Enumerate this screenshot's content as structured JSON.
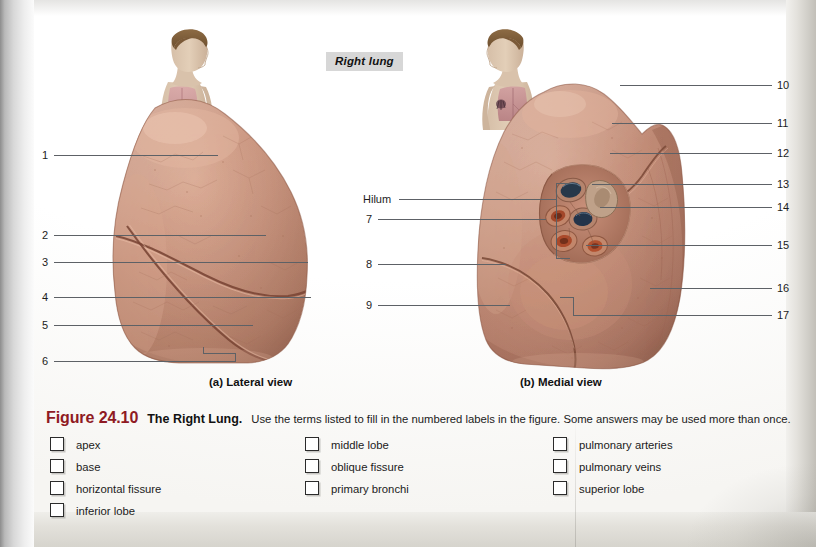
{
  "figure": {
    "panel_title": "Right lung",
    "view_a": "(a) Lateral view",
    "view_b": "(b) Medial view"
  },
  "leader_labels": {
    "left": [
      {
        "id": "1",
        "text": "1"
      },
      {
        "id": "2",
        "text": "2"
      },
      {
        "id": "3",
        "text": "3"
      },
      {
        "id": "4",
        "text": "4"
      },
      {
        "id": "5",
        "text": "5"
      },
      {
        "id": "6",
        "text": "6"
      }
    ],
    "middle": [
      {
        "id": "hilum",
        "text": "Hilum"
      },
      {
        "id": "7",
        "text": "7"
      },
      {
        "id": "8",
        "text": "8"
      },
      {
        "id": "9",
        "text": "9"
      }
    ],
    "right": [
      {
        "id": "10",
        "text": "10"
      },
      {
        "id": "11",
        "text": "11"
      },
      {
        "id": "12",
        "text": "12"
      },
      {
        "id": "13",
        "text": "13"
      },
      {
        "id": "14",
        "text": "14"
      },
      {
        "id": "15",
        "text": "15"
      },
      {
        "id": "16",
        "text": "16"
      },
      {
        "id": "17",
        "text": "17"
      }
    ]
  },
  "caption": {
    "figure_number": "Figure 24.10",
    "figure_title": "The Right Lung.",
    "instructions": "Use the terms listed to fill in the numbered labels in the figure. Some answers may be used more than once."
  },
  "term_bank": {
    "column1": [
      "apex",
      "base",
      "horizontal fissure",
      "inferior lobe"
    ],
    "column2": [
      "middle lobe",
      "oblique fissure",
      "primary bronchi"
    ],
    "column3": [
      "pulmonary arteries",
      "pulmonary veins",
      "superior lobe"
    ]
  },
  "colors": {
    "figure_number": "#8f1a23",
    "title_chip_bg": "#d7d7d7",
    "leader_line": "#5d6166",
    "lung_tissue": "#c08873",
    "lung_tissue_dark": "#9a6350",
    "bronchus": "#2e3f52",
    "vessel": "#b5502c"
  }
}
